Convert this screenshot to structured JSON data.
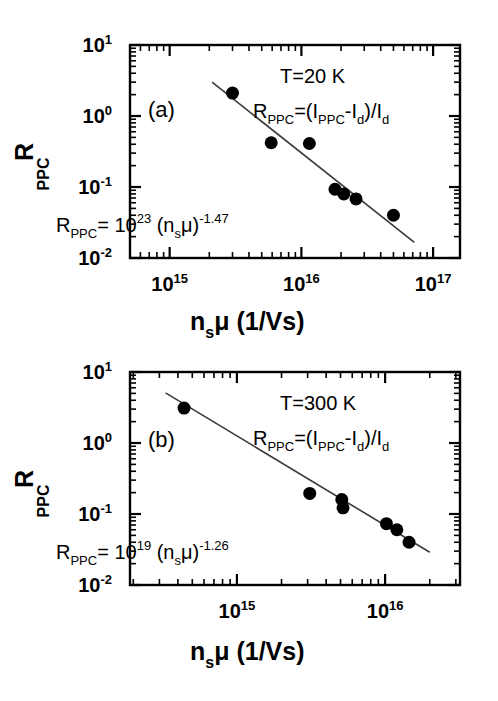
{
  "figure": {
    "background": "#ffffff",
    "ink": "#000000",
    "fit_line_color": "#3a3a3a"
  },
  "chart_data": [
    {
      "type": "scatter",
      "panel_label": "(a)",
      "title": "",
      "xlabel": "n_sμ (1/Vs)",
      "ylabel": "R_PPC",
      "xscale": "log",
      "yscale": "log",
      "xlim": [
        500000000000000.0,
        1.6e+17
      ],
      "ylim": [
        0.01,
        10
      ],
      "grid": false,
      "legend": "none",
      "xtick_labels": [
        "10^15",
        "10^16",
        "10^17"
      ],
      "xtick_values": [
        1000000000000000.0,
        1e+16,
        1e+17
      ],
      "ytick_labels": [
        "10^1",
        "10^0",
        "10^-1",
        "10^-2"
      ],
      "ytick_values": [
        10,
        1,
        0.1,
        0.01
      ],
      "annotations": [
        "T=20 K",
        "R_PPC=(I_PPC-I_d)/I_d",
        "R_PPC= 10^23 (n_sμ)^-1.47"
      ],
      "x": [
        3000000000000000.0,
        5900000000000000.0,
        1.15e+16,
        1.8e+16,
        2.1e+16,
        2.6e+16,
        5e+16
      ],
      "y": [
        2.1,
        0.42,
        0.41,
        0.093,
        0.08,
        0.068,
        0.04
      ],
      "fit": {
        "equation": "R_PPC = 10^23 (n_sμ)^-1.47",
        "prefactor_exponent": 23,
        "slope": -1.47,
        "x_start": 2100000000000000.0,
        "x_end": 7.2e+16
      }
    },
    {
      "type": "scatter",
      "panel_label": "(b)",
      "title": "",
      "xlabel": "n_sμ (1/Vs)",
      "ylabel": "R_PPC",
      "xscale": "log",
      "yscale": "log",
      "xlim": [
        190000000000000.0,
        3.2e+16
      ],
      "ylim": [
        0.01,
        10
      ],
      "grid": false,
      "legend": "none",
      "xtick_labels": [
        "10^15",
        "10^16"
      ],
      "xtick_values": [
        1000000000000000.0,
        1e+16
      ],
      "ytick_labels": [
        "10^1",
        "10^0",
        "10^-1",
        "10^-2"
      ],
      "ytick_values": [
        10,
        1,
        0.1,
        0.01
      ],
      "annotations": [
        "T=300 K",
        "R_PPC=(I_PPC-I_d)/I_d",
        "R_PPC= 10^19 (n_sμ)^-1.26"
      ],
      "x": [
        440000000000000.0,
        3100000000000000.0,
        5100000000000000.0,
        5200000000000000.0,
        1.02e+16,
        1.2e+16,
        1.45e+16
      ],
      "y": [
        3.1,
        0.195,
        0.16,
        0.122,
        0.073,
        0.06,
        0.04
      ],
      "fit": {
        "equation": "R_PPC = 10^19 (n_sμ)^-1.26",
        "prefactor_exponent": 19,
        "slope": -1.26,
        "x_start": 330000000000000.0,
        "x_end": 2e+16
      }
    }
  ],
  "panel_a": {
    "tag": "(a)",
    "temperature": "T=20 K",
    "formula_r": "R",
    "formula_r_sub": "PPC",
    "formula_eq_open": "=(I",
    "formula_i_sub": "PPC",
    "formula_minus_i": "-I",
    "formula_d_sub1": "d",
    "formula_close": ")/I",
    "formula_d_sub2": "d",
    "fit_r": "R",
    "fit_r_sub": "PPC",
    "fit_eq": "= 10",
    "fit_prefactor_exp": "23",
    "fit_paren_open": " (n",
    "fit_n_sub": "s",
    "fit_mu": "μ)",
    "fit_exp": "-1.47",
    "ylabel_main": "R",
    "ylabel_sub": "PPC",
    "xlabel_n": "n",
    "xlabel_n_sub": "s",
    "xlabel_mu": "μ (1/Vs)",
    "ytick_labels": [
      {
        "base": "10",
        "exp": "1"
      },
      {
        "base": "10",
        "exp": "0"
      },
      {
        "base": "10",
        "exp": "-1"
      },
      {
        "base": "10",
        "exp": "-2"
      }
    ],
    "xtick_labels": [
      {
        "base": "10",
        "exp": "15"
      },
      {
        "base": "10",
        "exp": "16"
      },
      {
        "base": "10",
        "exp": "17"
      }
    ]
  },
  "panel_b": {
    "tag": "(b)",
    "temperature": "T=300 K",
    "formula_r": "R",
    "formula_r_sub": "PPC",
    "formula_eq_open": "=(I",
    "formula_i_sub": "PPC",
    "formula_minus_i": "-I",
    "formula_d_sub1": "d",
    "formula_close": ")/I",
    "formula_d_sub2": "d",
    "fit_r": "R",
    "fit_r_sub": "PPC",
    "fit_eq": "= 10",
    "fit_prefactor_exp": "19",
    "fit_paren_open": " (n",
    "fit_n_sub": "s",
    "fit_mu": "μ)",
    "fit_exp": "-1.26",
    "ylabel_main": "R",
    "ylabel_sub": "PPC",
    "xlabel_n": "n",
    "xlabel_n_sub": "s",
    "xlabel_mu": "μ (1/Vs)",
    "ytick_labels": [
      {
        "base": "10",
        "exp": "1"
      },
      {
        "base": "10",
        "exp": "0"
      },
      {
        "base": "10",
        "exp": "-1"
      },
      {
        "base": "10",
        "exp": "-2"
      }
    ],
    "xtick_labels": [
      {
        "base": "10",
        "exp": "15"
      },
      {
        "base": "10",
        "exp": "16"
      }
    ]
  }
}
